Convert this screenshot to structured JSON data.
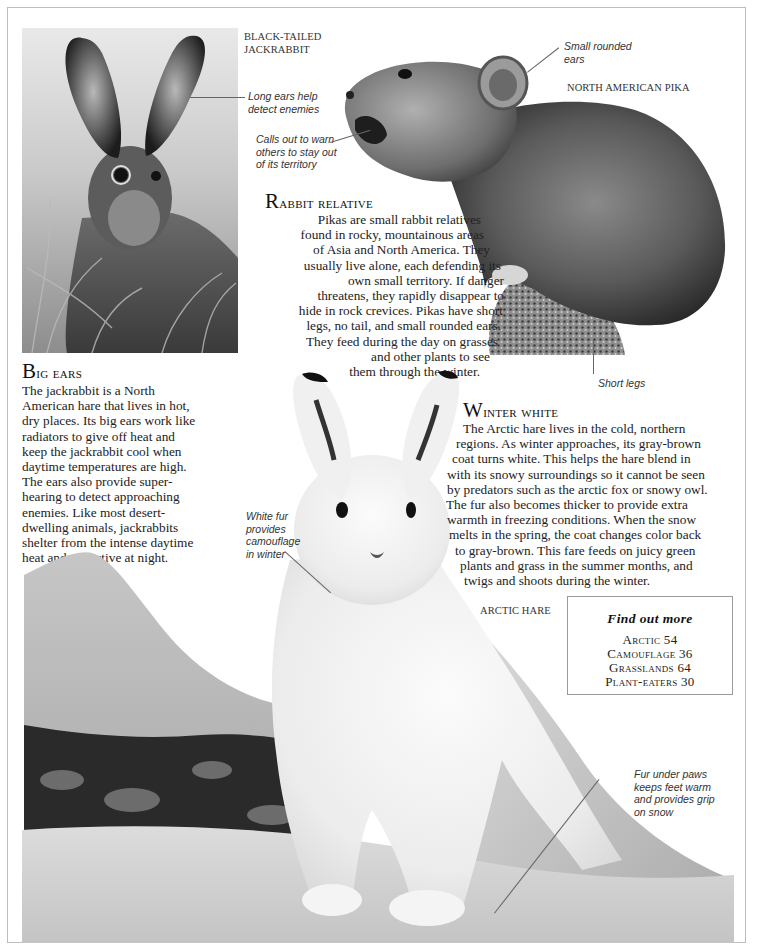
{
  "labels": {
    "jackrabbit": [
      "BLACK-TAILED",
      "JACKRABBIT"
    ],
    "pika": "NORTH AMERICAN PIKA",
    "arctic_hare": "ARCTIC HARE"
  },
  "captions": {
    "long_ears": [
      "Long ears help",
      "detect enemies"
    ],
    "calls_out": [
      "Calls out to warn",
      "others to stay out",
      "of its territory"
    ],
    "small_ears": [
      "Small rounded",
      "ears"
    ],
    "short_legs": "Short legs",
    "white_fur": [
      "White fur",
      "provides",
      "camouflage",
      "in winter"
    ],
    "fur_paws": [
      "Fur under paws",
      "keeps feet warm",
      "and provides grip",
      "on snow"
    ]
  },
  "sections": {
    "rabbit_relative": {
      "heading_cap": "R",
      "heading_rest": "abbit relative",
      "lines": [
        "Pikas are small rabbit relatives",
        "found in rocky, mountainous areas",
        "of Asia and North America. They",
        "usually live alone, each defending its",
        "own small territory. If danger",
        "threatens, they rapidly disappear to",
        "hide in rock crevices. Pikas have short",
        "legs, no tail, and small rounded ears.",
        "They feed during the day on grasses",
        "and other plants to see",
        "them through the winter."
      ]
    },
    "big_ears": {
      "heading_cap": "B",
      "heading_rest": "ig ears",
      "lines": [
        "The jackrabbit is a North",
        "American hare that lives in hot,",
        "dry places. Its big ears work like",
        "radiators to give off heat and",
        "keep the jackrabbit cool when",
        "daytime temperatures are high.",
        "The ears also provide super-",
        "hearing to detect approaching",
        "enemies. Like most desert-",
        "dwelling animals, jackrabbits",
        "shelter from the intense daytime",
        "heat and are active at night."
      ]
    },
    "winter_white": {
      "heading_cap": "W",
      "heading_rest": "inter white",
      "lines": [
        "The Arctic hare lives in the cold, northern",
        "regions. As winter approaches, its gray-brown",
        "coat turns white. This helps the hare blend in",
        "with its snowy surroundings so it cannot be seen",
        "by predators such as the arctic fox or snowy owl.",
        "The fur also becomes thicker to provide extra",
        "warmth in freezing conditions. When the snow",
        "melts in the spring, the coat changes color back",
        "to gray-brown. This fare feeds on juicy green",
        "plants and grass in the summer months, and",
        "twigs and shoots during the winter."
      ]
    }
  },
  "find_out_more": {
    "title": "Find out more",
    "items": [
      {
        "topic": "Arctic",
        "page": "54"
      },
      {
        "topic": "Camouflage",
        "page": "36"
      },
      {
        "topic": "Grasslands",
        "page": "64"
      },
      {
        "topic": "Plant-eaters",
        "page": "30"
      }
    ]
  },
  "images": {
    "jackrabbit_photo": "black-tailed-jackrabbit-photo",
    "pika_photo": "north-american-pika-photo",
    "arctic_hare_photo": "arctic-hare-photo"
  }
}
